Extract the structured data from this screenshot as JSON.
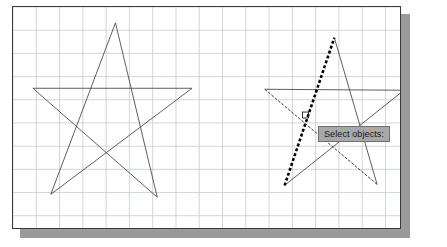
{
  "app": {
    "title": "CAD Drawing Area",
    "prompt_tooltip": "Select objects:"
  },
  "canvas": {
    "background_color": "#ffffff",
    "frame_color": "#3a3a3a",
    "shadow_color": "#9a9a9a",
    "grid_color": "#c3cbd4",
    "grid_spacing_px": 23.4,
    "width_px": 389,
    "height_px": 223
  },
  "style": {
    "line_color": "#4a4a4a",
    "line_width": 0.9,
    "selected_color": "#000000",
    "selected_width": 2.6,
    "selected_dash": "3,2.2",
    "dotted_dash": "2,2.4",
    "pickbox_color": "#1a1a1a",
    "tooltip_bg": "#a8a8a8",
    "tooltip_border": "#6f6f6f",
    "tooltip_text_color": "#161616"
  },
  "figures": [
    {
      "name": "star-left",
      "label": "unselected-pentagram",
      "vertices": [
        {
          "id": "top",
          "x": 116,
          "y": 23
        },
        {
          "id": "right-inner",
          "x": 193,
          "y": 89
        },
        {
          "id": "bottom-right",
          "x": 158,
          "y": 199
        },
        {
          "id": "bottom-left",
          "x": 51,
          "y": 196
        },
        {
          "id": "left-inner",
          "x": 33,
          "y": 89
        }
      ],
      "edges": [
        {
          "id": "e1",
          "from": "top",
          "to": "bottom-right",
          "style": "solid"
        },
        {
          "id": "e2",
          "from": "bottom-right",
          "to": "left-inner",
          "style": "solid"
        },
        {
          "id": "e3",
          "from": "left-inner",
          "to": "right-inner",
          "style": "solid"
        },
        {
          "id": "e4",
          "from": "right-inner",
          "to": "bottom-left",
          "style": "solid"
        },
        {
          "id": "e5",
          "from": "bottom-left",
          "to": "top",
          "style": "solid"
        }
      ]
    },
    {
      "name": "star-right",
      "label": "pentagram-with-selection",
      "vertices": [
        {
          "id": "top",
          "x": 336,
          "y": 38
        },
        {
          "id": "right-inner",
          "x": 406,
          "y": 91
        },
        {
          "id": "bottom-right",
          "x": 379,
          "y": 186
        },
        {
          "id": "bottom-left",
          "x": 286,
          "y": 187
        },
        {
          "id": "left-inner",
          "x": 266,
          "y": 90
        }
      ],
      "edges": [
        {
          "id": "e1",
          "from": "top",
          "to": "bottom-right",
          "style": "solid"
        },
        {
          "id": "e2",
          "from": "bottom-right",
          "to": "left-inner",
          "style": "dotted"
        },
        {
          "id": "e3",
          "from": "left-inner",
          "to": "right-inner",
          "style": "solid"
        },
        {
          "id": "e4",
          "from": "right-inner",
          "to": "bottom-left",
          "style": "solid"
        },
        {
          "id": "e5",
          "from": "bottom-left",
          "to": "top",
          "style": "selected"
        }
      ],
      "extra_edges": [
        {
          "id": "x1",
          "from": "left-inner",
          "to": "bottom-right",
          "style": "dotted"
        }
      ]
    }
  ],
  "cursor": {
    "name": "pickbox",
    "x": 307,
    "y": 116,
    "size_px": 6
  }
}
